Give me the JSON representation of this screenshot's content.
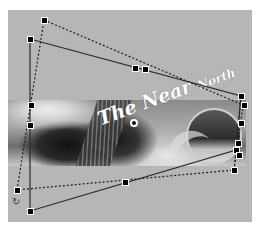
{
  "canvas": {
    "background": "#b5b5b5",
    "region": {
      "x": 8,
      "y": 10,
      "width": 244,
      "height": 212
    }
  },
  "image": {
    "description": "grayscale banner photo with road, dark trees, clouds and a globe",
    "title_text_part1": "The ",
    "title_text_part2": "Near ",
    "title_text_part3": "North",
    "text_color": "#ffffff"
  },
  "transform": {
    "mode": "distort",
    "center_marker": {
      "x": 134,
      "y": 123
    },
    "solid_outline": {
      "points": [
        [
          30,
          39
        ],
        [
          241,
          96
        ],
        [
          236,
          150
        ],
        [
          30,
          211
        ]
      ],
      "handles": [
        [
          30,
          39
        ],
        [
          135,
          68
        ],
        [
          241,
          96
        ],
        [
          236,
          123
        ],
        [
          236,
          150
        ],
        [
          125,
          182
        ],
        [
          30,
          211
        ],
        [
          30,
          123
        ]
      ],
      "color": "#2a2a2a"
    },
    "dashed_outline": {
      "points": [
        [
          44,
          20
        ],
        [
          243,
          105
        ],
        [
          234,
          170
        ],
        [
          17,
          190
        ]
      ],
      "handles": [
        [
          44,
          20
        ],
        [
          144,
          69
        ],
        [
          243,
          105
        ],
        [
          239,
          138
        ],
        [
          234,
          170
        ],
        [
          125,
          180
        ],
        [
          17,
          190
        ],
        [
          31,
          105
        ]
      ],
      "color": "#222222"
    },
    "rotate_icon": "rotate-cursor-icon"
  }
}
